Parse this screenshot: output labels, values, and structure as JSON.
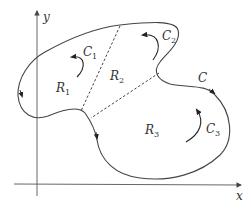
{
  "diagram": {
    "title": "",
    "axes": {
      "x_label": "x",
      "y_label": "y"
    },
    "curve": {
      "name": "C",
      "label": "C"
    },
    "regions": [
      {
        "id": "R1",
        "base": "R",
        "sub": "1"
      },
      {
        "id": "R2",
        "base": "R",
        "sub": "2"
      },
      {
        "id": "R3",
        "base": "R",
        "sub": "3"
      }
    ],
    "subcurves": [
      {
        "id": "C1",
        "base": "C",
        "sub": "1"
      },
      {
        "id": "C2",
        "base": "C",
        "sub": "2"
      },
      {
        "id": "C3",
        "base": "C",
        "sub": "3"
      }
    ],
    "colors": {
      "stroke": "#444444",
      "axis": "#555555",
      "background": "#ffffff"
    }
  }
}
